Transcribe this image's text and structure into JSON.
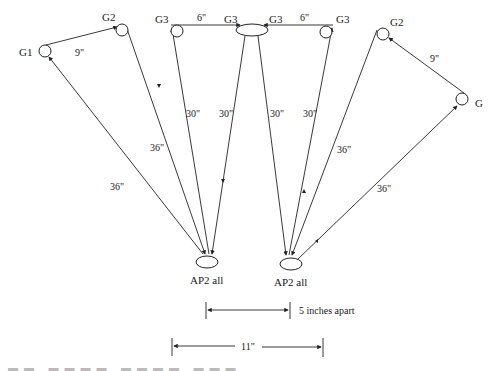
{
  "diagram": {
    "nodes": {
      "g1": "G1",
      "g2_left": "G2",
      "g3_far_left": "G3",
      "g3_center_left": "G3",
      "g3_center_right": "G3",
      "g3_far_right": "G3",
      "g2_right": "G2",
      "g_right": "G",
      "ap2_left": "AP2 all",
      "ap2_right": "AP2 all"
    },
    "edge_labels": {
      "g1_g2_left": "9\"",
      "g3_top_left": "6\"",
      "g3_top_right": "6\"",
      "g2_right_g_right": "9\"",
      "g1_ap2_left": "36\"",
      "g2_left_ap2_left": "36\"",
      "g3_far_left_ap2_left": "30\"",
      "center_ap2_left": "30\"",
      "center_ap2_right": "30\"",
      "g3_far_right_ap2_right": "30\"",
      "g2_right_ap2_right": "36\"",
      "g_right_ap2_right": "36\""
    },
    "dimensions": {
      "ap_spacing": "5 inches apart",
      "total_width": "11\""
    }
  }
}
